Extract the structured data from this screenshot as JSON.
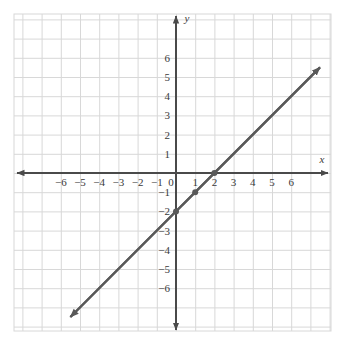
{
  "figure": {
    "kind": "coordinate-plane-graph",
    "background_color": "#ffffff",
    "grid_color": "#d8d8d8",
    "axis_color": "#4a4a4a",
    "line_color": "#595959",
    "point_color": "#595959",
    "x_axis_name": "x",
    "y_axis_name": "y"
  },
  "chart_data": {
    "type": "line",
    "title": "",
    "subtitle": "",
    "xlabel": "x",
    "ylabel": "y",
    "xlim": [
      -7.5,
      7.5
    ],
    "ylim": [
      -7.5,
      7.5
    ],
    "grid": true,
    "legend": "none",
    "x_ticks": [
      -6,
      -5,
      -4,
      -3,
      -2,
      -1,
      0,
      1,
      2,
      3,
      4,
      5,
      6
    ],
    "y_ticks": [
      -6,
      -5,
      -4,
      -3,
      -2,
      -1,
      1,
      2,
      3,
      4,
      5,
      6
    ],
    "x_tick_labels": [
      "-6",
      "-5",
      "-4",
      "-3",
      "-2",
      "-1",
      "0",
      "1",
      "2",
      "3",
      "4",
      "5",
      "6"
    ],
    "y_tick_labels": [
      "-6",
      "-5",
      "-4",
      "-3",
      "-2",
      "-1",
      "1",
      "2",
      "3",
      "4",
      "5",
      "6"
    ],
    "series": [
      {
        "name": "y = x - 2",
        "equation": "y = x - 2",
        "slope": 1,
        "y_intercept": -2,
        "x_intercept": 2,
        "arrows": "both",
        "endpoints": [
          {
            "x": -5.5,
            "y": -7.5
          },
          {
            "x": 7.5,
            "y": 5.5
          }
        ],
        "marked_points": [
          {
            "x": 0,
            "y": -2
          },
          {
            "x": 1,
            "y": -1
          },
          {
            "x": 2,
            "y": 0
          }
        ]
      }
    ]
  }
}
